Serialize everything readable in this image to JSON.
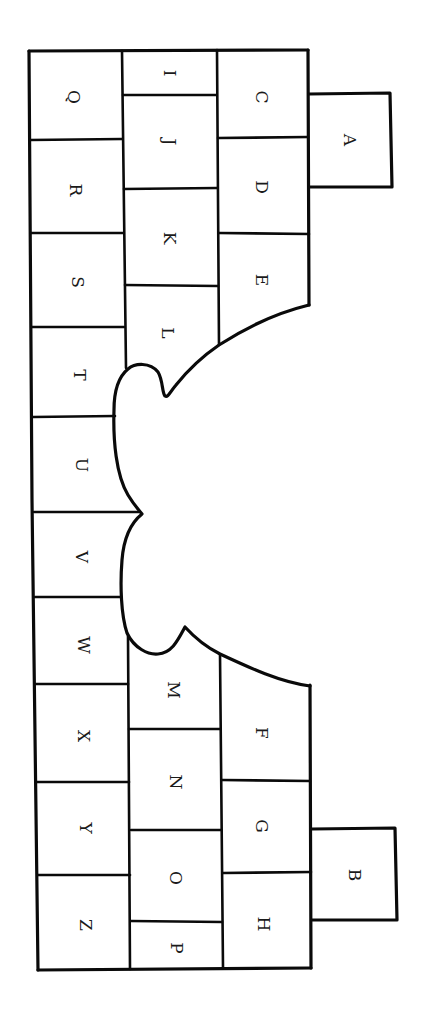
{
  "diagram": {
    "title": "",
    "orientation": "rotated-90-clockwise",
    "stroke_color": "#0a0a0a",
    "background": "#ffffff",
    "cells": [
      {
        "id": "A",
        "label": "A",
        "x": 350,
        "y": 140
      },
      {
        "id": "B",
        "label": "B",
        "x": 355,
        "y": 875
      },
      {
        "id": "C",
        "label": "C",
        "x": 262,
        "y": 97
      },
      {
        "id": "D",
        "label": "D",
        "x": 262,
        "y": 187
      },
      {
        "id": "E",
        "label": "E",
        "x": 262,
        "y": 280
      },
      {
        "id": "F",
        "label": "F",
        "x": 262,
        "y": 733
      },
      {
        "id": "G",
        "label": "G",
        "x": 262,
        "y": 826
      },
      {
        "id": "H",
        "label": "H",
        "x": 264,
        "y": 924
      },
      {
        "id": "I",
        "label": "I",
        "x": 170,
        "y": 73
      },
      {
        "id": "J",
        "label": "J",
        "x": 170,
        "y": 142
      },
      {
        "id": "K",
        "label": "K",
        "x": 170,
        "y": 238
      },
      {
        "id": "L",
        "label": "L",
        "x": 168,
        "y": 333
      },
      {
        "id": "M",
        "label": "M",
        "x": 174,
        "y": 690
      },
      {
        "id": "N",
        "label": "N",
        "x": 176,
        "y": 782
      },
      {
        "id": "O",
        "label": "O",
        "x": 176,
        "y": 878
      },
      {
        "id": "P",
        "label": "P",
        "x": 177,
        "y": 948
      },
      {
        "id": "Q",
        "label": "Q",
        "x": 74,
        "y": 97
      },
      {
        "id": "R",
        "label": "R",
        "x": 76,
        "y": 190
      },
      {
        "id": "S",
        "label": "S",
        "x": 78,
        "y": 282
      },
      {
        "id": "T",
        "label": "T",
        "x": 80,
        "y": 375
      },
      {
        "id": "U",
        "label": "U",
        "x": 82,
        "y": 465
      },
      {
        "id": "V",
        "label": "V",
        "x": 82,
        "y": 557
      },
      {
        "id": "W",
        "label": "W",
        "x": 84,
        "y": 645
      },
      {
        "id": "X",
        "label": "X",
        "x": 84,
        "y": 736
      },
      {
        "id": "Y",
        "label": "Y",
        "x": 86,
        "y": 828
      },
      {
        "id": "Z",
        "label": "Z",
        "x": 86,
        "y": 925
      }
    ]
  }
}
